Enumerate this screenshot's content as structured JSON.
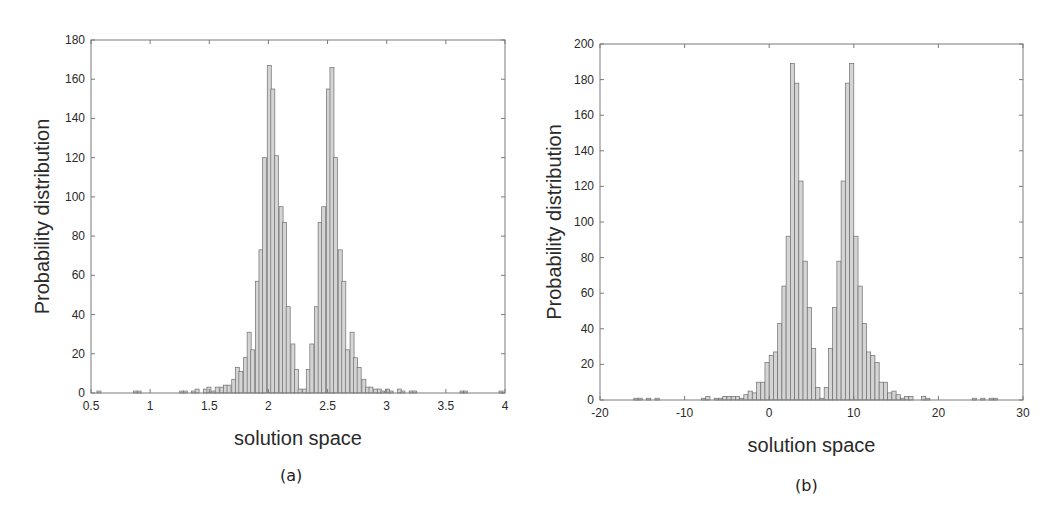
{
  "chart_data": [
    {
      "id": "a",
      "type": "bar",
      "subtype": "histogram",
      "caption": "(a)",
      "title": "",
      "xlabel": "solution space",
      "ylabel": "Probability distribution",
      "xlim": [
        0.5,
        4
      ],
      "ylim": [
        0,
        180
      ],
      "xticks": [
        0.5,
        1,
        1.5,
        2,
        2.5,
        3,
        3.5,
        4
      ],
      "xtick_labels": [
        "0.5",
        "1",
        "1.5",
        "2",
        "2.5",
        "3",
        "3.5",
        "4"
      ],
      "yticks": [
        0,
        20,
        40,
        60,
        80,
        100,
        120,
        140,
        160,
        180
      ],
      "ytick_labels": [
        "0",
        "20",
        "40",
        "60",
        "80",
        "100",
        "120",
        "140",
        "160",
        "180"
      ],
      "grid": false,
      "legend": null,
      "bin_width": 0.034,
      "bins_start": [
        0.55,
        0.86,
        0.89,
        1.25,
        1.28,
        1.35,
        1.38,
        1.45,
        1.48,
        1.52,
        1.55,
        1.59,
        1.62,
        1.65,
        1.69,
        1.72,
        1.75,
        1.79,
        1.82,
        1.85,
        1.89,
        1.92,
        1.95,
        1.99,
        2.02,
        2.05,
        2.09,
        2.12,
        2.15,
        2.19,
        2.22,
        2.25,
        2.29,
        2.32,
        2.35,
        2.39,
        2.42,
        2.45,
        2.49,
        2.52,
        2.55,
        2.59,
        2.62,
        2.65,
        2.69,
        2.72,
        2.75,
        2.79,
        2.82,
        2.85,
        2.89,
        2.92,
        2.95,
        2.99,
        3.02,
        3.09,
        3.12,
        3.19,
        3.22,
        3.62,
        3.65,
        3.95
      ],
      "values": [
        1,
        1,
        1,
        1,
        1,
        1,
        2,
        2,
        3,
        1,
        3,
        3,
        4,
        4,
        7,
        13,
        11,
        18,
        31,
        22,
        57,
        73,
        120,
        167,
        155,
        121,
        95,
        87,
        44,
        25,
        12,
        2,
        2,
        12,
        25,
        44,
        87,
        95,
        155,
        166,
        120,
        73,
        57,
        22,
        31,
        18,
        13,
        7,
        3,
        3,
        2,
        2,
        1,
        2,
        1,
        2,
        1,
        1,
        1,
        1,
        1,
        1
      ],
      "peaks": [
        {
          "x": 2.03,
          "y": 167
        },
        {
          "x": 2.54,
          "y": 166
        }
      ]
    },
    {
      "id": "b",
      "type": "bar",
      "subtype": "histogram",
      "caption": "(b)",
      "title": "",
      "xlabel": "solution space",
      "ylabel": "Probability distribution",
      "xlim": [
        -20,
        30
      ],
      "ylim": [
        0,
        200
      ],
      "xticks": [
        -20,
        -10,
        0,
        10,
        20,
        30
      ],
      "xtick_labels": [
        "-20",
        "-10",
        "0",
        "10",
        "20",
        "30"
      ],
      "yticks": [
        0,
        20,
        40,
        60,
        80,
        100,
        120,
        140,
        160,
        180,
        200
      ],
      "ytick_labels": [
        "0",
        "20",
        "40",
        "60",
        "80",
        "100",
        "120",
        "140",
        "160",
        "180",
        "200"
      ],
      "grid": false,
      "legend": null,
      "bin_width": 0.5,
      "bins_start": [
        -16,
        -15.5,
        -14.5,
        -13.5,
        -8,
        -7.5,
        -6.5,
        -6,
        -5.5,
        -5,
        -4.5,
        -4,
        -3.5,
        -3,
        -2.5,
        -2,
        -1.5,
        -1,
        -0.5,
        0,
        0.5,
        1,
        1.5,
        2,
        2.5,
        3,
        3.5,
        4,
        4.5,
        5,
        5.5,
        6,
        6.5,
        7,
        7.5,
        8,
        8.5,
        9,
        9.5,
        10,
        10.5,
        11,
        11.5,
        12,
        12.5,
        13,
        13.5,
        14,
        14.5,
        15,
        15.5,
        16,
        16.5,
        18,
        18.5,
        24,
        25,
        26,
        26.5
      ],
      "values": [
        1,
        1,
        1,
        1,
        1,
        2,
        1,
        1,
        2,
        2,
        2,
        2,
        1,
        3,
        5,
        4,
        10,
        10,
        21,
        25,
        27,
        43,
        64,
        92,
        189,
        178,
        123,
        78,
        52,
        29,
        7,
        1,
        7,
        29,
        52,
        78,
        123,
        178,
        189,
        92,
        64,
        43,
        27,
        25,
        21,
        10,
        10,
        4,
        5,
        3,
        1,
        2,
        2,
        2,
        1,
        1,
        1,
        1,
        1
      ],
      "peaks": [
        {
          "x": 2.25,
          "y": 189
        },
        {
          "x": 8.75,
          "y": 189
        }
      ]
    }
  ],
  "panels": {
    "a": {
      "caption": "(a)",
      "xlabel": "solution space",
      "ylabel": "Probability distribution"
    },
    "b": {
      "caption": "(b)",
      "xlabel": "solution space",
      "ylabel": "Probability distribution"
    }
  },
  "colors": {
    "bar_fill": "#d4d4d4",
    "bar_stroke": "#6e6e6e",
    "axis": "#7a7a7a",
    "text": "#2a2a2a"
  }
}
